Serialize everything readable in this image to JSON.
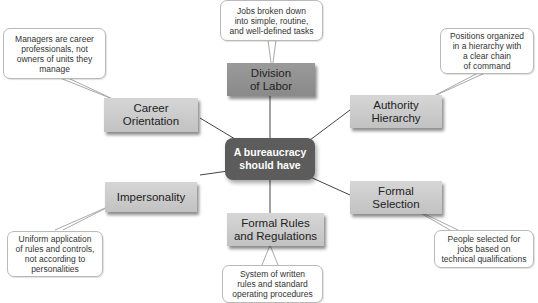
{
  "diagram": {
    "type": "concept-map",
    "center": {
      "label": "A bureaucracy\nshould have",
      "color": "#5c5c5c"
    },
    "nodes": [
      {
        "id": "division-of-labor",
        "label": "Division\nof Labor",
        "description": "Jobs broken down\ninto simple, routine,\nand well-defined tasks"
      },
      {
        "id": "authority-hierarchy",
        "label": "Authority\nHierarchy",
        "description": "Positions organized\nin a hierarchy with\na clear chain\nof command"
      },
      {
        "id": "formal-selection",
        "label": "Formal\nSelection",
        "description": "People selected for\njobs based on\ntechnical qualifications"
      },
      {
        "id": "formal-rules",
        "label": "Formal Rules\nand Regulations",
        "description": "System of written\nrules and standard\noperating procedures"
      },
      {
        "id": "impersonality",
        "label": "Impersonality",
        "description": "Uniform application\nof rules and controls,\nnot according to\npersonalities"
      },
      {
        "id": "career-orientation",
        "label": "Career\nOrientation",
        "description": "Managers are career\nprofessionals, not\nowners of units they\nmanage"
      }
    ],
    "colors": {
      "node_fill": "#cacaca",
      "node_dark_fill": "#939393",
      "line": "#444444",
      "bubble_border": "#b9b9b9"
    }
  }
}
